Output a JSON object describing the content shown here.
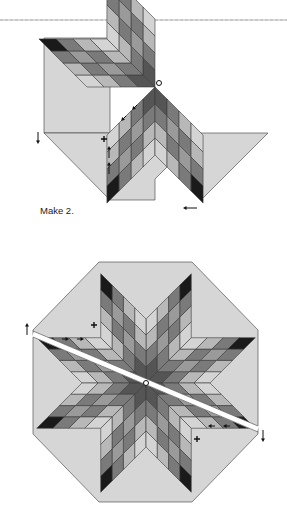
{
  "figure": {
    "caption": "Make 2.",
    "colors": {
      "background_triangle": "#d6d6d6",
      "outline": "#3a3a3a",
      "shades": [
        "#1a1a1a",
        "#555555",
        "#7a7a7a",
        "#9a9a9a",
        "#b8b8b8",
        "#d4d4d4"
      ]
    },
    "shade_rows": [
      [
        0,
        2,
        4,
        5
      ],
      [
        2,
        3,
        2,
        4
      ],
      [
        4,
        2,
        3,
        2
      ],
      [
        5,
        4,
        2,
        1
      ]
    ],
    "diagram_top": {
      "name": "half-lone-star-unit",
      "center": [
        155,
        87
      ],
      "points": [
        {
          "angle": 135,
          "side": 1
        },
        {
          "angle": 180,
          "side": 1
        },
        {
          "angle": 90,
          "side": 1
        },
        {
          "angle": 45,
          "side": 1
        }
      ],
      "cell": 17,
      "background_shapes": [
        {
          "name": "left-setting-square",
          "points": [
            [
              44,
              38
            ],
            [
              44,
              133
            ],
            [
              110,
              133
            ],
            [
              110,
              38
            ]
          ]
        },
        {
          "name": "bottom-setting-triangle",
          "points": [
            [
              110,
              133
            ],
            [
              201,
              133
            ],
            [
              155,
              179
            ],
            [
              155,
              200
            ],
            [
              110,
              200
            ]
          ]
        },
        {
          "name": "right-setting-triangle",
          "points": [
            [
              201,
              133
            ],
            [
              268,
              133
            ],
            [
              201,
              200
            ]
          ]
        },
        {
          "name": "left-lower-triangle",
          "points": [
            [
              44,
              133
            ],
            [
              110,
              133
            ],
            [
              110,
              200
            ]
          ]
        }
      ],
      "markers": [
        {
          "type": "circle",
          "x": 159,
          "y": 83
        },
        {
          "type": "plus",
          "x": 104,
          "y": 139
        },
        {
          "type": "arrow-down",
          "x": 38,
          "y": 132
        },
        {
          "type": "arrow-left",
          "x": 197,
          "y": 208
        },
        {
          "type": "arrow-up",
          "x": 109,
          "y": 158
        },
        {
          "type": "arrow-up",
          "x": 109,
          "y": 174
        },
        {
          "type": "arrow-downleft",
          "x": 137,
          "y": 105
        },
        {
          "type": "arrow-downleft",
          "x": 126,
          "y": 116
        }
      ]
    },
    "diagram_bottom": {
      "name": "assembled-lone-star-octagon",
      "center": [
        146,
        383
      ],
      "cell": 16,
      "octagon": [
        [
          99,
          262
        ],
        [
          192,
          262
        ],
        [
          258,
          330
        ],
        [
          258,
          434
        ],
        [
          192,
          502
        ],
        [
          99,
          502
        ],
        [
          33,
          434
        ],
        [
          33,
          330
        ]
      ],
      "seam_gap": {
        "from": [
          33,
          334
        ],
        "to": [
          258,
          429
        ]
      },
      "markers": [
        {
          "type": "circle",
          "x": 146,
          "y": 383
        },
        {
          "type": "plus",
          "x": 94,
          "y": 325
        },
        {
          "type": "plus",
          "x": 197,
          "y": 439
        },
        {
          "type": "arrow-up",
          "x": 27,
          "y": 335
        },
        {
          "type": "arrow-down",
          "x": 263,
          "y": 430
        },
        {
          "type": "arrow-right",
          "x": 62,
          "y": 339
        },
        {
          "type": "arrow-right",
          "x": 77,
          "y": 339
        },
        {
          "type": "arrow-left",
          "x": 215,
          "y": 426
        },
        {
          "type": "arrow-left",
          "x": 230,
          "y": 426
        }
      ]
    }
  }
}
